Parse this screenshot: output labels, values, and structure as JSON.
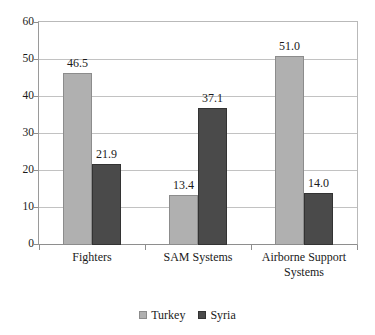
{
  "chart_data": {
    "type": "bar",
    "title": "",
    "subtitle": "",
    "xlabel": "",
    "ylabel": "",
    "categories": [
      "Fighters",
      "SAM Systems",
      "Airborne Support Systems"
    ],
    "series": [
      {
        "name": "Turkey",
        "values": [
          46.5,
          13.4,
          51.0
        ],
        "color": "#b0b0b0"
      },
      {
        "name": "Syria",
        "values": [
          21.9,
          37.1,
          14.0
        ],
        "color": "#4a4a4a"
      }
    ],
    "value_labels": [
      [
        "46.5",
        "13.4",
        "51.0"
      ],
      [
        "21.9",
        "37.1",
        "14.0"
      ]
    ],
    "ylim": [
      0,
      60
    ],
    "ytick_values": [
      0,
      10,
      20,
      30,
      40,
      50,
      60
    ],
    "ytick_labels": [
      "0",
      "10",
      "20",
      "30",
      "40",
      "50",
      "60"
    ],
    "grid": "horizontal",
    "legend_position": "bottom-center",
    "legend_entries": [
      "Turkey",
      "Syria"
    ],
    "category_label_lines": [
      [
        "Fighters"
      ],
      [
        "SAM Systems"
      ],
      [
        "Airborne Support",
        "Systems"
      ]
    ]
  },
  "colors": {
    "series_turkey": "#b0b0b0",
    "series_syria": "#4a4a4a",
    "gridline": "#c2c2c2",
    "axis": "#8e8e8e",
    "text": "#1a1a1a",
    "background": "#ffffff"
  }
}
